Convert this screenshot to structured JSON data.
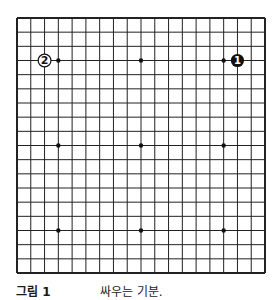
{
  "board": {
    "size": 19,
    "origin": [
      17,
      18
    ],
    "extent": [
      265,
      273
    ],
    "line_color": "#222222",
    "hoshi": [
      [
        3,
        3
      ],
      [
        9,
        3
      ],
      [
        15,
        3
      ],
      [
        3,
        9
      ],
      [
        9,
        9
      ],
      [
        15,
        9
      ],
      [
        3,
        15
      ],
      [
        9,
        15
      ],
      [
        15,
        15
      ]
    ],
    "stones": [
      {
        "color": "black",
        "col": 16,
        "row": 3,
        "label": "1"
      },
      {
        "color": "white",
        "col": 2,
        "row": 3,
        "label": "2"
      }
    ]
  },
  "caption": {
    "label": "그림 1",
    "description": "싸우는 기분."
  }
}
